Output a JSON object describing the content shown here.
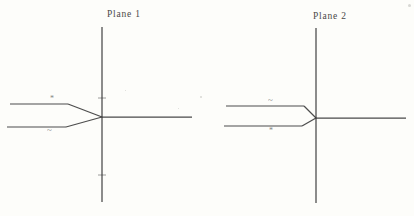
{
  "figure": {
    "background_color": "#fdfdfa",
    "ink_color": "#3a3a3a",
    "width": 414,
    "height": 216
  },
  "panels": [
    {
      "id": "plane-1",
      "title": "Plane 1",
      "title_x": 107,
      "title_y": 9,
      "origin_x": 102,
      "origin_y": 117,
      "axes": {
        "vertical_top_y": 27,
        "vertical_bottom_y": 202,
        "horizontal_right_x": 192,
        "ticks_y": [
          98,
          175
        ],
        "tick_half_width": 4
      },
      "branch_cut": {
        "upper_left_x": 10,
        "upper_left_y": 104,
        "upper_bend_x": 68,
        "upper_bend_y": 104,
        "lower_left_x": 7,
        "lower_left_y": 127,
        "lower_bend_x": 66,
        "lower_bend_y": 127
      },
      "marks": [
        {
          "name": "upper-sheet-mark",
          "glyph": "*",
          "kind": "star",
          "x": 50,
          "y": 95
        },
        {
          "name": "lower-sheet-mark",
          "glyph": "~",
          "kind": "tilde",
          "x": 47,
          "y": 126
        }
      ]
    },
    {
      "id": "plane-2",
      "title": "Plane 2",
      "title_x": 313,
      "title_y": 11,
      "origin_x": 316,
      "origin_y": 118,
      "axes": {
        "vertical_top_y": 28,
        "vertical_bottom_y": 203,
        "horizontal_right_x": 406,
        "ticks_y": [],
        "tick_half_width": 4
      },
      "branch_cut": {
        "upper_left_x": 226,
        "upper_left_y": 106,
        "upper_bend_x": 304,
        "upper_bend_y": 106,
        "lower_left_x": 224,
        "lower_left_y": 126,
        "lower_bend_x": 302,
        "lower_bend_y": 126
      },
      "marks": [
        {
          "name": "upper-sheet-mark",
          "glyph": "~",
          "kind": "tilde",
          "x": 268,
          "y": 96
        },
        {
          "name": "lower-sheet-mark",
          "glyph": "*",
          "kind": "star",
          "x": 269,
          "y": 127
        }
      ]
    }
  ],
  "chart_data": {
    "type": "diagram",
    "subtitle": "",
    "xlabel": "",
    "ylabel": "",
    "panels": [
      {
        "label": "Plane 1",
        "description": "Complex plane with a branch cut along the negative real axis; the cut opens into a wedge that closes at the origin.",
        "upper_edge_label": "*",
        "lower_edge_label": "~",
        "origin": [
          0,
          0
        ],
        "cut_direction": "negative real axis",
        "axis_ticks_vertical": 2
      },
      {
        "label": "Plane 2",
        "description": "Second sheet of the same surface; edge labels are interchanged relative to Plane 1.",
        "upper_edge_label": "~",
        "lower_edge_label": "*",
        "origin": [
          0,
          0
        ],
        "cut_direction": "negative real axis",
        "axis_ticks_vertical": 0
      }
    ],
    "legend": [],
    "grid": false
  },
  "specks": [
    {
      "x": 200,
      "y": 96,
      "size": 2
    },
    {
      "x": 178,
      "y": 108,
      "size": 1
    },
    {
      "x": 125,
      "y": 90,
      "size": 1
    },
    {
      "x": 408,
      "y": 4,
      "size": 3
    }
  ]
}
